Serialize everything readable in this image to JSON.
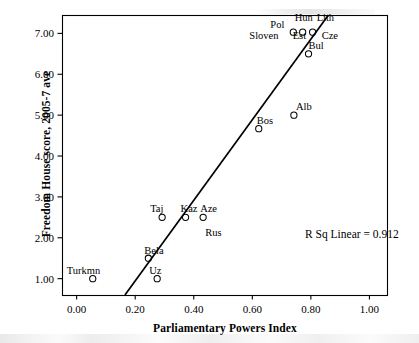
{
  "chart_data": {
    "type": "scatter",
    "title": "",
    "xlabel": "Parliamentary Powers Index",
    "ylabel": "Freedom House score, 2005-7 ave",
    "xlim": [
      -0.05,
      1.06
    ],
    "ylim": [
      0.6,
      7.45
    ],
    "xticks": [
      "0.00",
      "0.20",
      "0.40",
      "0.60",
      "0.80",
      "1.00"
    ],
    "xtick_values": [
      0.0,
      0.2,
      0.4,
      0.6,
      0.8,
      1.0
    ],
    "yticks": [
      "1.00",
      "2.00",
      "3.00",
      "4.00",
      "5.00",
      "6.00",
      "7.00"
    ],
    "ytick_values": [
      1,
      2,
      3,
      4,
      5,
      6,
      7
    ],
    "grid": false,
    "legend": "none",
    "annotation": "R Sq Linear = 0.912",
    "r_squared": 0.912,
    "marker": "open-circle",
    "fit_line": {
      "type": "linear",
      "x_start": 0.165,
      "y_start": 0.6,
      "x_end": 0.86,
      "y_end": 7.45
    },
    "points": [
      {
        "label": "Turkmn",
        "x": 0.055,
        "y": 1.0,
        "label_dx": -26,
        "label_dy": -13
      },
      {
        "label": "Uz",
        "x": 0.275,
        "y": 1.0,
        "label_dx": -8,
        "label_dy": -13
      },
      {
        "label": "Bela",
        "x": 0.245,
        "y": 1.5,
        "label_dx": -4,
        "label_dy": -12
      },
      {
        "label": "Taj",
        "x": 0.292,
        "y": 2.5,
        "label_dx": -12,
        "label_dy": -13
      },
      {
        "label": "Kaz",
        "x": 0.372,
        "y": 2.5,
        "label_dx": -5,
        "label_dy": -13
      },
      {
        "label": "Aze",
        "x": 0.432,
        "y": 2.5,
        "label_dx": -3,
        "label_dy": -13
      },
      {
        "label": "Rus",
        "x": 0.432,
        "y": 2.5,
        "label_dx": 2,
        "label_dy": 11
      },
      {
        "label": "Bos",
        "x": 0.622,
        "y": 4.67,
        "label_dx": -2,
        "label_dy": -13
      },
      {
        "label": "Alb",
        "x": 0.742,
        "y": 5.0,
        "label_dx": 2,
        "label_dy": -13
      },
      {
        "label": "Bul",
        "x": 0.792,
        "y": 6.5,
        "label_dx": 0,
        "label_dy": -13
      },
      {
        "label": "Pol",
        "x": 0.74,
        "y": 7.03,
        "label_dx": -23,
        "label_dy": -12
      },
      {
        "label": "Hun",
        "x": 0.772,
        "y": 7.03,
        "label_dx": -8,
        "label_dy": -19
      },
      {
        "label": "Lith",
        "x": 0.806,
        "y": 7.03,
        "label_dx": 4,
        "label_dy": -19
      },
      {
        "label": "Sloven",
        "x": 0.74,
        "y": 7.03,
        "label_dx": -44,
        "label_dy": -1
      },
      {
        "label": "Est",
        "x": 0.772,
        "y": 7.03,
        "label_dx": -10,
        "label_dy": -1
      },
      {
        "label": "Cze",
        "x": 0.806,
        "y": 7.03,
        "label_dx": 9,
        "label_dy": -1
      }
    ]
  }
}
